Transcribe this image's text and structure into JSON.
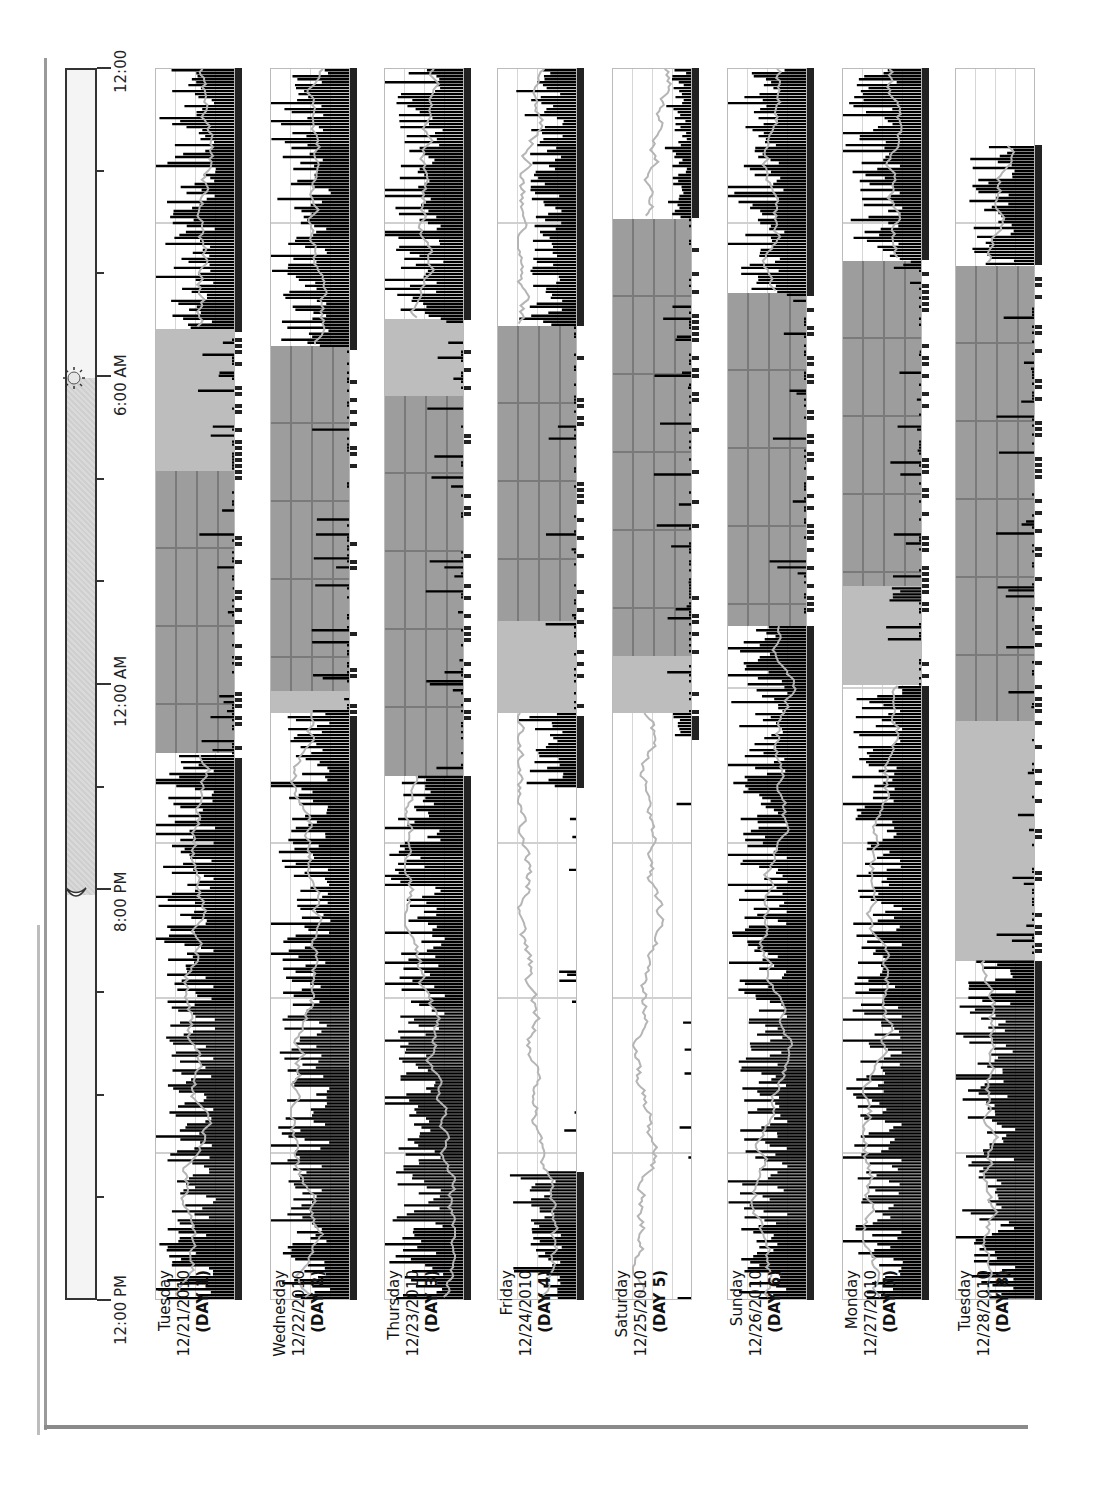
{
  "chart_data": {
    "type": "actogram",
    "title": "",
    "orientation": "rotated-90-ccw",
    "time_axis": {
      "label": "",
      "ticks": [
        "12:00 PM",
        "8:00 PM",
        "12:00 AM",
        "6:00 AM",
        "12:00"
      ],
      "range": [
        "12:00 PM",
        "12:00 PM (+24h)"
      ],
      "minor_tick_interval_hours": 2
    },
    "day_night_indicator": {
      "night_start": "8:00 PM",
      "night_end": "6:00 AM",
      "moon_icon_at": "8:00 PM",
      "sun_icon_at": "6:00 AM"
    },
    "legend": {
      "activity": "black bars",
      "light": "gray line",
      "rest_interval": "light gray shading",
      "sleep_interval": "dark gray shading"
    },
    "days": [
      {
        "weekday": "Tuesday",
        "date": "12/21/2010",
        "day": "(DAY 1)",
        "rest": [
          "10:40 PM",
          "6:56 AM"
        ],
        "sleep": [
          "10:40 PM",
          "4:10 AM"
        ],
        "activity_level": "high",
        "data_end": "12:00"
      },
      {
        "weekday": "Wednesday",
        "date": "12/22/2010",
        "day": "(DAY 2)",
        "rest": [
          "11:27 PM",
          "6:36 AM"
        ],
        "sleep": [
          "11:53 PM",
          "6:36 AM"
        ],
        "activity_level": "high",
        "data_end": "12:00"
      },
      {
        "weekday": "Thursday",
        "date": "12/23/2010",
        "day": "(DAY 3)",
        "rest": [
          "10:14 PM",
          "7:08 AM"
        ],
        "sleep": [
          "10:14 PM",
          "5:38 AM"
        ],
        "activity_level": "high",
        "data_end": "12:00"
      },
      {
        "weekday": "Friday",
        "date": "12/24/2010",
        "day": "(DAY 4)",
        "rest": [
          "11:27 PM",
          "7:00 AM"
        ],
        "sleep": [
          "1:15 AM",
          "7:00 AM"
        ],
        "activity_level": "medium",
        "off_wrist": [
          "2:30 PM",
          "10:00 PM"
        ],
        "data_end": "12:00"
      },
      {
        "weekday": "Saturday",
        "date": "12/25/2010",
        "day": "(DAY 5)",
        "rest": [
          "11:27 PM",
          "9:05 AM"
        ],
        "sleep": [
          "12:34 AM",
          "9:05 AM"
        ],
        "activity_level": "low",
        "off_wrist": [
          "12:00 PM",
          "11:00 PM"
        ],
        "data_end": "12:00"
      },
      {
        "weekday": "Sunday",
        "date": "12/26/2010",
        "day": "(DAY 6)",
        "rest": [
          "1:09 AM",
          "7:38 AM"
        ],
        "sleep": [
          "1:09 AM",
          "7:38 AM"
        ],
        "activity_level": "high",
        "data_end": "12:00"
      },
      {
        "weekday": "Monday",
        "date": "12/27/2010",
        "day": "(DAY 7)",
        "rest": [
          "12:00 AM",
          "8:16 AM"
        ],
        "sleep": [
          "1:56 AM",
          "8:16 AM"
        ],
        "activity_level": "high",
        "data_end": "12:00"
      },
      {
        "weekday": "Tuesday",
        "date": "12/28/2010",
        "day": "(DAY 8)",
        "rest": [
          "6:37 PM",
          "8:10 AM"
        ],
        "sleep": [
          "11:18 PM",
          "8:10 AM"
        ],
        "activity_level": "high",
        "data_end": "10:30 AM"
      }
    ]
  },
  "axis": {
    "t_12pm": "12:00 PM",
    "t_8pm": "8:00 PM",
    "t_12am": "12:00 AM",
    "t_6am": "6:00 AM",
    "t_12": "12:00"
  },
  "icons": {
    "sun": "sun-icon",
    "moon": "moon-icon"
  },
  "colors": {
    "activity": "#000000",
    "light_line": "#b5b5b5",
    "rest": "#bdbdbd",
    "sleep": "#9d9d9d",
    "grid": "#d0d0d0",
    "night": "#d4d4d4"
  }
}
